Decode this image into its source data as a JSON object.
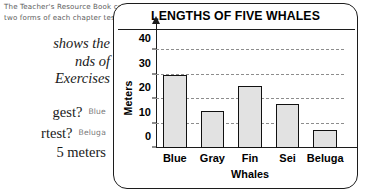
{
  "page": {
    "teacher_note": "The Teacher's Resource Book contains two forms of each chapter test.",
    "prose_lines": [
      "shows the",
      "nds of",
      "Exercises"
    ],
    "questions": [
      {
        "prompt": "gest?",
        "answer": "Blue"
      },
      {
        "prompt": "rtest?",
        "answer": "Beluga"
      }
    ],
    "tail_line": "5 meters"
  },
  "chart_data": {
    "type": "bar",
    "title": "LENGTHS OF FIVE WHALES",
    "xlabel": "Whales",
    "ylabel": "Meters",
    "categories": [
      "Blue",
      "Gray",
      "Fin",
      "Sei",
      "Beluga"
    ],
    "values": [
      30,
      15,
      25.5,
      18,
      7.5
    ],
    "yticks": [
      0,
      10,
      20,
      30,
      40
    ],
    "ylim": [
      0,
      45
    ],
    "grid": true,
    "grid_style": "dashed-horizontal",
    "legend": "none",
    "bar_fill": "#e2e2e2",
    "bar_stroke": "#111111",
    "axis_color": "#1c1c1c",
    "grid_color": "#8d8d8d"
  }
}
